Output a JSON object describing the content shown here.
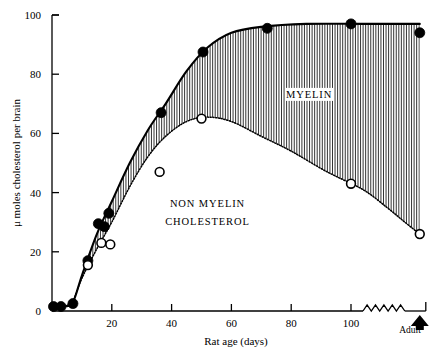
{
  "chart_data": {
    "type": "line",
    "title": "",
    "xlabel": "Rat age (days)",
    "ylabel": "μ moles cholesterol per brain",
    "xlim": [
      0,
      125
    ],
    "ylim": [
      0,
      100
    ],
    "xticks": [
      20,
      40,
      60,
      80,
      100
    ],
    "xtick_labels": [
      "20",
      "40",
      "60",
      "80",
      "100"
    ],
    "yticks": [
      0,
      20,
      40,
      60,
      80,
      100
    ],
    "ytick_labels": [
      "0",
      "20",
      "40",
      "60",
      "80",
      "100"
    ],
    "grid": false,
    "legend_position": "inside-annotations",
    "axis_break": {
      "label": "Adult",
      "style": "zigzag",
      "marker": "up-arrowhead",
      "x_start": 104,
      "x_end": 118,
      "adult_x": 123
    },
    "annotations": [
      {
        "text": "MYELIN",
        "x": 86,
        "y": 72
      },
      {
        "text": "NON MYELIN",
        "x": 52,
        "y": 35
      },
      {
        "text": "CHOLESTEROL",
        "x": 52,
        "y": 29
      }
    ],
    "series": [
      {
        "name": "Total cholesterol (filled circles)",
        "marker": "filled-circle",
        "points": [
          {
            "x": 0.5,
            "y": 1.5
          },
          {
            "x": 3.0,
            "y": 1.5
          },
          {
            "x": 7.0,
            "y": 2.5
          },
          {
            "x": 12.0,
            "y": 17.0
          },
          {
            "x": 15.5,
            "y": 29.5
          },
          {
            "x": 17.5,
            "y": 28.5
          },
          {
            "x": 19.0,
            "y": 33.0
          },
          {
            "x": 36.5,
            "y": 67.0
          },
          {
            "x": 50.5,
            "y": 87.5
          },
          {
            "x": 72.0,
            "y": 95.5
          },
          {
            "x": 100.0,
            "y": 97.0
          },
          {
            "x": 123.0,
            "y": 94.0
          }
        ]
      },
      {
        "name": "Non-myelin cholesterol (open circles)",
        "marker": "open-circle",
        "points": [
          {
            "x": 12.0,
            "y": 15.5
          },
          {
            "x": 16.5,
            "y": 23.0
          },
          {
            "x": 19.5,
            "y": 22.5
          },
          {
            "x": 36.0,
            "y": 47.0
          },
          {
            "x": 50.0,
            "y": 65.0
          },
          {
            "x": 100.0,
            "y": 43.0
          },
          {
            "x": 123.0,
            "y": 26.0
          }
        ]
      }
    ],
    "curves": [
      {
        "name": "total-cholesterol-curve",
        "style": "solid",
        "points": [
          {
            "x": 1.0,
            "y": 1.0
          },
          {
            "x": 4.0,
            "y": 1.5
          },
          {
            "x": 7.0,
            "y": 3.0
          },
          {
            "x": 10.0,
            "y": 12.0
          },
          {
            "x": 15.0,
            "y": 26.0
          },
          {
            "x": 20.0,
            "y": 37.0
          },
          {
            "x": 26.0,
            "y": 50.0
          },
          {
            "x": 32.0,
            "y": 61.0
          },
          {
            "x": 38.0,
            "y": 70.0
          },
          {
            "x": 45.0,
            "y": 81.0
          },
          {
            "x": 52.0,
            "y": 89.0
          },
          {
            "x": 60.0,
            "y": 94.0
          },
          {
            "x": 70.0,
            "y": 96.0
          },
          {
            "x": 85.0,
            "y": 97.0
          },
          {
            "x": 104.0,
            "y": 97.0
          },
          {
            "x": 118.0,
            "y": 97.0
          },
          {
            "x": 123.0,
            "y": 97.0
          }
        ]
      },
      {
        "name": "non-myelin-cholesterol-curve",
        "style": "dotted",
        "points": [
          {
            "x": 7.0,
            "y": 3.0
          },
          {
            "x": 10.0,
            "y": 11.0
          },
          {
            "x": 15.0,
            "y": 21.0
          },
          {
            "x": 20.0,
            "y": 30.0
          },
          {
            "x": 26.0,
            "y": 42.0
          },
          {
            "x": 32.0,
            "y": 52.0
          },
          {
            "x": 38.0,
            "y": 59.0
          },
          {
            "x": 45.0,
            "y": 64.0
          },
          {
            "x": 52.0,
            "y": 65.5
          },
          {
            "x": 60.0,
            "y": 64.0
          },
          {
            "x": 70.0,
            "y": 59.0
          },
          {
            "x": 80.0,
            "y": 54.0
          },
          {
            "x": 92.0,
            "y": 47.0
          },
          {
            "x": 104.0,
            "y": 41.0
          },
          {
            "x": 112.0,
            "y": 35.0
          },
          {
            "x": 118.0,
            "y": 30.0
          },
          {
            "x": 123.0,
            "y": 26.0
          }
        ]
      }
    ],
    "shaded_region": {
      "name": "myelin",
      "hatch": "vertical-lines",
      "color": "#000000",
      "between": [
        "total-cholesterol-curve",
        "non-myelin-cholesterol-curve"
      ]
    }
  }
}
